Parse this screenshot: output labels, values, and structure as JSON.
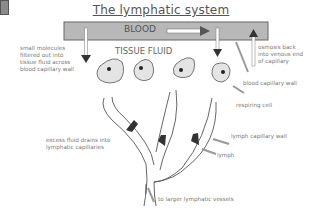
{
  "title": "The lymphatic system",
  "blood_label": "BLOOD",
  "tissue_fluid_label": "TISSUE FLUID",
  "annotations": {
    "filtered": [
      "small molecules",
      "filtered out into",
      "tissue fluid across",
      "blood capillary wall"
    ],
    "osmosis": [
      "osmosis back",
      "into venous end",
      "of capillary"
    ],
    "blood_capillary_wall": "blood capillary wall",
    "respiring_cell": "respiring cell",
    "excess_fluid": [
      "excess fluid drains into",
      "lymphatic capillaries"
    ],
    "lymph_capillary_wall": "lymph capillary wall",
    "lymph": "lymph",
    "larger_vessels": "to larger lymphatic vessels"
  },
  "colors": {
    "capillary_fill": "#b8b8b8",
    "cell_fill": "#e4e4e4",
    "arrow": "#444444",
    "text": "#777777"
  }
}
